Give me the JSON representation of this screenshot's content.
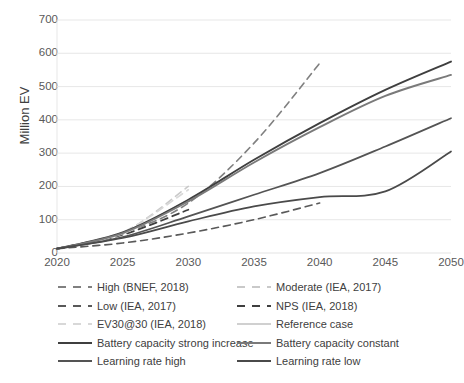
{
  "chart_data": {
    "type": "line",
    "title": "",
    "xlabel": "",
    "ylabel": "Million EV",
    "xlim": [
      2020,
      2050
    ],
    "ylim": [
      0,
      700
    ],
    "grid": true,
    "legend_position": "bottom",
    "xticks": [
      2020,
      2025,
      2030,
      2035,
      2040,
      2045,
      2050
    ],
    "yticks": [
      0,
      100,
      200,
      300,
      400,
      500,
      600,
      700
    ],
    "series": [
      {
        "name": "High (BNEF, 2018)",
        "style": "dashed",
        "color": "#808080",
        "width": 1.6,
        "x": [
          2020,
          2025,
          2030,
          2035,
          2040
        ],
        "values": [
          13,
          60,
          150,
          330,
          570
        ]
      },
      {
        "name": "Moderate (IEA, 2017)",
        "style": "dashed",
        "color": "#c9c9c9",
        "width": 1.6,
        "x": [
          2020,
          2025,
          2030
        ],
        "values": [
          13,
          60,
          200
        ]
      },
      {
        "name": "Low (IEA, 2017)",
        "style": "dashed",
        "color": "#595959",
        "width": 1.6,
        "x": [
          2020,
          2025,
          2030,
          2035,
          2040
        ],
        "values": [
          13,
          30,
          60,
          100,
          150
        ]
      },
      {
        "name": "NPS (IEA, 2018)",
        "style": "dashed",
        "color": "#3f3f3f",
        "width": 1.8,
        "x": [
          2020,
          2025,
          2030
        ],
        "values": [
          13,
          55,
          130
        ]
      },
      {
        "name": "EV30@30 (IEA, 2018)",
        "style": "dashed",
        "color": "#d8d8d8",
        "width": 1.6,
        "x": [
          2020,
          2025,
          2030
        ],
        "values": [
          13,
          62,
          190
        ]
      },
      {
        "name": "Reference case",
        "style": "solid",
        "color": "#d0d0d0",
        "width": 1.6,
        "x": [
          2020,
          2025,
          2030
        ],
        "values": [
          13,
          58,
          160
        ]
      },
      {
        "name": "Battery capacity strong increase",
        "style": "solid",
        "color": "#3f3f3f",
        "width": 1.9,
        "x": [
          2020,
          2025,
          2030,
          2035,
          2040,
          2045,
          2050
        ],
        "values": [
          13,
          62,
          160,
          280,
          390,
          490,
          575
        ]
      },
      {
        "name": "Battery capacity constant",
        "style": "solid",
        "color": "#7a7a7a",
        "width": 1.9,
        "x": [
          2020,
          2025,
          2030,
          2035,
          2040,
          2045,
          2050
        ],
        "values": [
          13,
          60,
          155,
          272,
          378,
          472,
          535
        ]
      },
      {
        "name": "Learning rate high",
        "style": "solid",
        "color": "#545454",
        "width": 1.7,
        "x": [
          2020,
          2025,
          2030,
          2035,
          2040,
          2045,
          2050
        ],
        "values": [
          13,
          48,
          110,
          175,
          240,
          320,
          405
        ]
      },
      {
        "name": "Learning rate low",
        "style": "solid",
        "color": "#4a4a4a",
        "width": 1.7,
        "x": [
          2020,
          2025,
          2030,
          2035,
          2040,
          2045,
          2050
        ],
        "values": [
          13,
          45,
          95,
          140,
          168,
          185,
          305
        ]
      }
    ]
  },
  "axis": {
    "y_title": "Million EV",
    "y_labels": [
      "700",
      "600",
      "500",
      "400",
      "300",
      "200",
      "100",
      "0"
    ],
    "x_labels": [
      "2020",
      "2025",
      "2030",
      "2035",
      "2040",
      "2045",
      "2050"
    ]
  },
  "legend": {
    "items": [
      {
        "label": "High (BNEF, 2018)",
        "style": "dashed",
        "color": "#808080",
        "col": 0,
        "row": 0
      },
      {
        "label": "Moderate (IEA, 2017)",
        "style": "dashed",
        "color": "#c9c9c9",
        "col": 1,
        "row": 0
      },
      {
        "label": "Low (IEA, 2017)",
        "style": "dashed",
        "color": "#595959",
        "col": 0,
        "row": 1
      },
      {
        "label": "NPS (IEA, 2018)",
        "style": "dashed",
        "color": "#3f3f3f",
        "col": 1,
        "row": 1
      },
      {
        "label": "EV30@30 (IEA, 2018)",
        "style": "dashed",
        "color": "#d8d8d8",
        "col": 0,
        "row": 2
      },
      {
        "label": "Reference case",
        "style": "solid",
        "color": "#d0d0d0",
        "col": 1,
        "row": 2
      },
      {
        "label": "Battery capacity strong increase",
        "style": "solid",
        "color": "#3f3f3f",
        "col": 0,
        "row": 3
      },
      {
        "label": "Battery capacity constant",
        "style": "solid",
        "color": "#7a7a7a",
        "col": 1,
        "row": 3
      },
      {
        "label": "Learning rate high",
        "style": "solid",
        "color": "#545454",
        "col": 0,
        "row": 4
      },
      {
        "label": "Learning rate low",
        "style": "solid",
        "color": "#4a4a4a",
        "col": 1,
        "row": 4
      }
    ]
  },
  "colors": {
    "gridline": "#e4e4e4",
    "tick_text": "#595959",
    "axis_title": "#404040",
    "background": "#ffffff"
  }
}
